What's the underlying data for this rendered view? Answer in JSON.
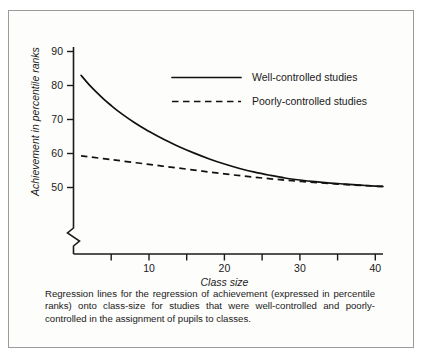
{
  "figure": {
    "caption": "Regression lines for the regression of achievement (expressed in percentile ranks) onto class-size for studies that were well-controlled and poorly-controlled in the assignment of pupils to classes."
  },
  "chart_data": {
    "type": "line",
    "title": "",
    "xlabel": "Class size",
    "ylabel": "Achievement in percentile ranks",
    "xlim": [
      0,
      41
    ],
    "ylim": [
      45,
      92
    ],
    "grid": false,
    "axis_break_y": true,
    "legend_position": "upper-right-inside",
    "xticks": [
      5,
      10,
      15,
      20,
      25,
      30,
      35,
      40
    ],
    "xticklabels": [
      "",
      "10",
      "",
      "20",
      "",
      "30",
      "",
      "40"
    ],
    "yticks": [
      50,
      60,
      70,
      80,
      90
    ],
    "yticklabels": [
      "50",
      "60",
      "70",
      "80",
      "90"
    ],
    "series": [
      {
        "name": "Well-controlled studies",
        "style": "solid",
        "color": "#111111",
        "x": [
          1,
          2,
          3,
          4,
          5,
          6,
          7,
          8,
          9,
          10,
          12,
          14,
          16,
          18,
          20,
          22,
          24,
          26,
          28,
          30,
          32,
          34,
          36,
          38,
          40,
          41
        ],
        "values": [
          83.0,
          80.4,
          78.1,
          76.0,
          74.1,
          72.3,
          70.7,
          69.2,
          67.8,
          66.5,
          64.1,
          62.0,
          60.1,
          58.4,
          56.9,
          55.6,
          54.5,
          53.6,
          52.8,
          52.2,
          51.7,
          51.3,
          51.0,
          50.7,
          50.4,
          50.3
        ]
      },
      {
        "name": "Poorly-controlled studies",
        "style": "dashed",
        "color": "#111111",
        "x": [
          1,
          5,
          10,
          15,
          20,
          25,
          30,
          35,
          40,
          41
        ],
        "values": [
          59.3,
          58.2,
          56.8,
          55.4,
          54.0,
          52.8,
          51.8,
          51.0,
          50.4,
          50.3
        ]
      }
    ]
  },
  "legend": {
    "entries": [
      {
        "label": "Well-controlled studies",
        "style": "solid"
      },
      {
        "label": "Poorly-controlled studies",
        "style": "dashed"
      }
    ]
  }
}
